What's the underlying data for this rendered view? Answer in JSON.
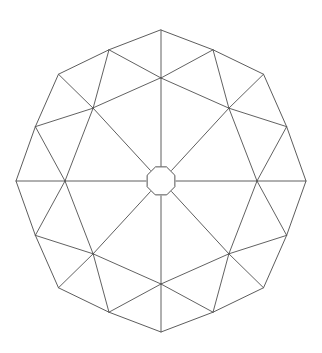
{
  "figure": {
    "kind": "geodesic-dome-wireframe",
    "background_color": "#ffffff",
    "stroke_color": "#474747",
    "stroke_width": 0.9,
    "canvas": {
      "width": 322,
      "height": 353
    },
    "center": {
      "x": 161,
      "y": 181
    },
    "symmetry_order": 8,
    "rings": [
      {
        "name": "hub",
        "role": "central octagon",
        "vertex_count": 8,
        "radius_x": 15,
        "radius_y": 15,
        "angle_offset_deg": 22.5
      },
      {
        "name": "inner",
        "role": "ridge junction ring",
        "vertex_count": 8,
        "radius_x": 96,
        "radius_y": 103,
        "angle_offset_deg": 0
      },
      {
        "name": "outer-ridge",
        "role": "outer polygon apex vertices aligned with spokes",
        "vertex_count": 8,
        "radius_x": 145,
        "radius_y": 151,
        "angle_offset_deg": 0
      },
      {
        "name": "outer-between",
        "role": "outer polygon vertices between spokes",
        "vertex_count": 8,
        "radius_x": 136,
        "radius_y": 142,
        "angle_offset_deg": 22.5
      }
    ],
    "edge_groups": [
      {
        "name": "hub-octagon",
        "count": 8
      },
      {
        "name": "spokes-hub-to-inner",
        "count": 8
      },
      {
        "name": "inner-ring-chords",
        "count": 8
      },
      {
        "name": "inner-to-outer-ridge",
        "count": 16
      },
      {
        "name": "outer-perimeter",
        "count": 16
      },
      {
        "name": "inner-to-outer-between",
        "count": 8
      }
    ],
    "total_vertices": 32,
    "total_edges": 64,
    "key_points": {
      "top_apex": {
        "x": 161,
        "y": 30
      },
      "bottom_apex": {
        "x": 161,
        "y": 332
      },
      "left_apex": {
        "x": 16,
        "y": 181
      },
      "right_apex": {
        "x": 306,
        "y": 181
      }
    }
  }
}
